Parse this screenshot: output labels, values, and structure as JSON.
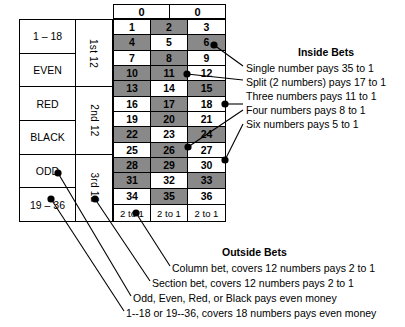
{
  "table": {
    "zero_cells": [
      "0",
      "0"
    ],
    "outside_left": [
      {
        "label": "1 – 18"
      },
      {
        "label": "EVEN"
      },
      {
        "label": "RED"
      },
      {
        "label": "BLACK"
      },
      {
        "label": "ODD"
      },
      {
        "label": "19 – 36"
      }
    ],
    "dozens": [
      "1st 12",
      "2nd 12",
      "3rd 12"
    ],
    "numbers": [
      {
        "n": "1",
        "dark": false
      },
      {
        "n": "2",
        "dark": true
      },
      {
        "n": "3",
        "dark": false
      },
      {
        "n": "4",
        "dark": true
      },
      {
        "n": "5",
        "dark": false
      },
      {
        "n": "6",
        "dark": true
      },
      {
        "n": "7",
        "dark": false
      },
      {
        "n": "8",
        "dark": true
      },
      {
        "n": "9",
        "dark": false
      },
      {
        "n": "10",
        "dark": true
      },
      {
        "n": "11",
        "dark": true
      },
      {
        "n": "12",
        "dark": false
      },
      {
        "n": "13",
        "dark": true
      },
      {
        "n": "14",
        "dark": false
      },
      {
        "n": "15",
        "dark": true
      },
      {
        "n": "16",
        "dark": false
      },
      {
        "n": "17",
        "dark": true
      },
      {
        "n": "18",
        "dark": false
      },
      {
        "n": "19",
        "dark": false
      },
      {
        "n": "20",
        "dark": true
      },
      {
        "n": "21",
        "dark": false
      },
      {
        "n": "22",
        "dark": true
      },
      {
        "n": "23",
        "dark": false
      },
      {
        "n": "24",
        "dark": true
      },
      {
        "n": "25",
        "dark": false
      },
      {
        "n": "26",
        "dark": true
      },
      {
        "n": "27",
        "dark": false
      },
      {
        "n": "28",
        "dark": true
      },
      {
        "n": "29",
        "dark": true
      },
      {
        "n": "30",
        "dark": false
      },
      {
        "n": "31",
        "dark": true
      },
      {
        "n": "32",
        "dark": false
      },
      {
        "n": "33",
        "dark": true
      },
      {
        "n": "34",
        "dark": false
      },
      {
        "n": "35",
        "dark": true
      },
      {
        "n": "36",
        "dark": false
      }
    ],
    "column_bets": [
      "2 to 1",
      "2 to 1",
      "2 to 1"
    ]
  },
  "inside_bets": {
    "heading": "Inside Bets",
    "items": [
      "Single number pays 35 to 1",
      "Split (2 numbers) pays 17 to 1",
      "Three numbers pays 11 to 1",
      "Four numbers pays 8 to 1",
      "Six numbers pays 5 to 1"
    ]
  },
  "outside_bets": {
    "heading": "Outside Bets",
    "items": [
      "Column bet, covers 12 numbers pays 2 to 1",
      "Section bet, covers 12 numbers pays 2 to 1",
      "Odd, Even, Red, or Black pays even money",
      "1--18 or 19--36, covers 18 numbers pays even money"
    ]
  },
  "colors": {
    "ink": "#000000",
    "dark_cell": "#898989",
    "light_cell": "#ffffff",
    "background": "#ffffff"
  }
}
